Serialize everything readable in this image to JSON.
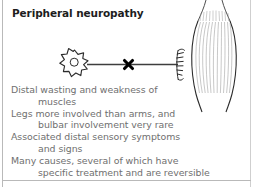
{
  "title": "Peripheral neuropathy",
  "colors": {
    "background": "#ffffff",
    "border": "#b9b9b9",
    "title_text": "#1d1d1d",
    "body_text": "#6f6f6f",
    "diagram_stroke": "#2b2b2b",
    "muscle_fiber": "#8c8c8c",
    "lesion_marker": "#000000"
  },
  "bullets": [
    {
      "line1": "Distal wasting and weakness of",
      "line2": "muscles"
    },
    {
      "line1": "Legs more involved than arms, and",
      "line2": "bulbar involvement very rare"
    },
    {
      "line1": "Associated distal sensory symptoms",
      "line2": "and signs"
    },
    {
      "line1": "Many causes, several of which have",
      "line2": "specific treatment and are reversible"
    }
  ],
  "diagram": {
    "name": "motor-neuron-to-muscle-schematic",
    "parts": [
      {
        "name": "neuron-cell-body",
        "shape": "star-soma"
      },
      {
        "name": "neuron-nucleus",
        "shape": "circle"
      },
      {
        "name": "axon",
        "shape": "horizontal-line"
      },
      {
        "name": "lesion-marker",
        "shape": "cross-x"
      },
      {
        "name": "nerve-terminal",
        "shape": "branching-endplate"
      },
      {
        "name": "muscle",
        "shape": "fusiform-spindle"
      },
      {
        "name": "muscle-fibres",
        "shape": "vertical-striations"
      },
      {
        "name": "tendon-upper",
        "shape": "taper-lines"
      },
      {
        "name": "tendon-lower",
        "shape": "taper-lines"
      }
    ]
  }
}
